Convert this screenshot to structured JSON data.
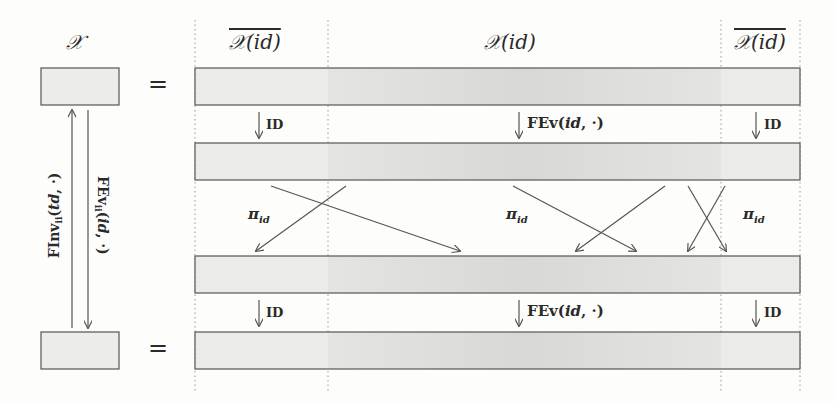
{
  "left": {
    "set_label": "𝒳",
    "equals": "=",
    "up_arrow_label": {
      "main": "FInv",
      "sub": "ii",
      "arg_italic": "td",
      "rest": ", ·)"
    },
    "down_arrow_label": {
      "main": "FEv",
      "sub": "ii",
      "arg_italic": "id",
      "rest": ", ·)"
    }
  },
  "columns": [
    {
      "label": "𝒳(id)",
      "overline": true
    },
    {
      "label": "𝒳(id)",
      "overline": false
    },
    {
      "label": "𝒳(id)",
      "overline": true
    }
  ],
  "rows": {
    "count": 4
  },
  "arrows_row1": [
    {
      "label": "ID"
    },
    {
      "label_main": "FEv(",
      "label_italic": "id",
      "label_rest": ", ·)"
    },
    {
      "label": "ID"
    }
  ],
  "arrows_row3": [
    {
      "label": "ID"
    },
    {
      "label_main": "FEv(",
      "label_italic": "id",
      "label_rest": ", ·)"
    },
    {
      "label": "ID"
    }
  ],
  "permutation": {
    "symbol": "π",
    "sub": "id",
    "labels_count": 3
  },
  "colors": {
    "bar_fill_light": "#ebebe8",
    "bar_fill_dark": "#dcdcda",
    "bar_stroke": "#555555",
    "arrow": "#555555",
    "dotted": "#999999"
  }
}
